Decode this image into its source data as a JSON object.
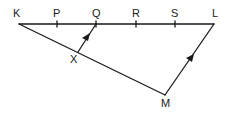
{
  "diagram": {
    "stroke_color": "#1a1a1a",
    "background": "#ffffff",
    "points": {
      "K": {
        "label": "K",
        "x": 19,
        "y": 24
      },
      "P": {
        "label": "P",
        "x": 57,
        "y": 24
      },
      "Q": {
        "label": "Q",
        "x": 96,
        "y": 24
      },
      "R": {
        "label": "R",
        "x": 136,
        "y": 24
      },
      "S": {
        "label": "S",
        "x": 175,
        "y": 24
      },
      "L": {
        "label": "L",
        "x": 214,
        "y": 24
      },
      "X": {
        "label": "X",
        "x": 78,
        "y": 52
      },
      "M": {
        "label": "M",
        "x": 165,
        "y": 95
      }
    },
    "segments": [
      {
        "from": "K",
        "to": "L",
        "name": "segment-KL"
      },
      {
        "from": "K",
        "to": "M",
        "name": "segment-KM"
      },
      {
        "from": "M",
        "to": "L",
        "name": "segment-ML",
        "arrow": true
      },
      {
        "from": "X",
        "to": "Q",
        "name": "segment-XQ",
        "arrow": true
      }
    ],
    "tick_marks_on_KL": [
      "P",
      "Q",
      "R",
      "S"
    ]
  }
}
